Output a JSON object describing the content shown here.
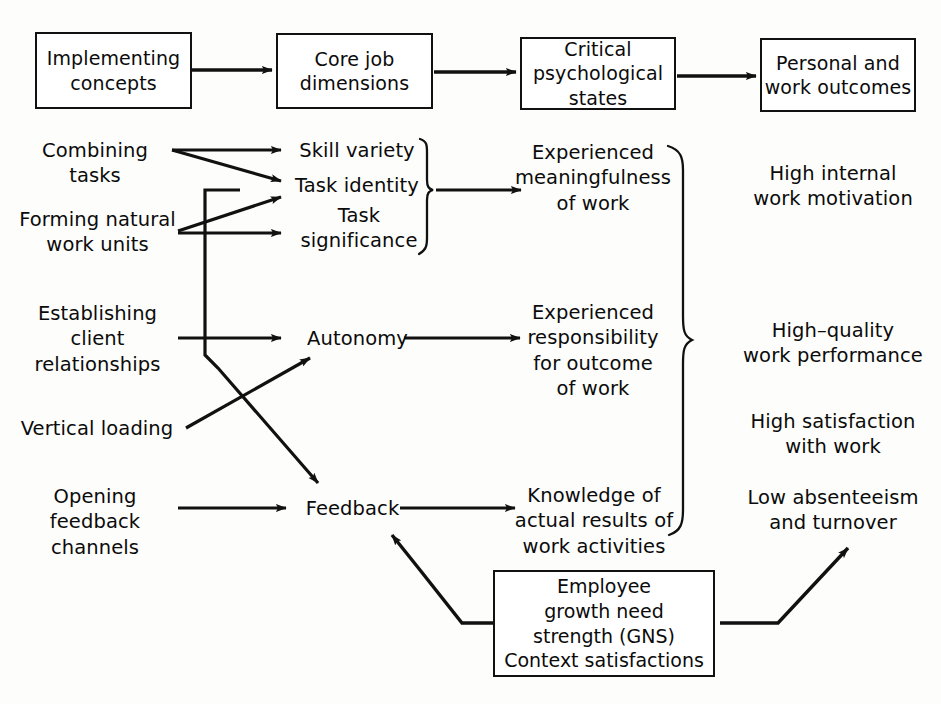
{
  "diagram": {
    "header_boxes": [
      {
        "id": "implementing-concepts",
        "label": "Implementing\nconcepts"
      },
      {
        "id": "core-job-dimensions",
        "label": "Core job\ndimensions"
      },
      {
        "id": "critical-psychological-states",
        "label": "Critical\npsychological\nstates"
      },
      {
        "id": "personal-and-work-outcomes",
        "label": "Personal and\nwork outcomes"
      }
    ],
    "implementing_concepts": [
      {
        "id": "combining-tasks",
        "label": "Combining tasks"
      },
      {
        "id": "forming-natural-work-units",
        "label": "Forming natural\nwork units"
      },
      {
        "id": "establishing-client-relationships",
        "label": "Establishing\nclient\nrelationships"
      },
      {
        "id": "vertical-loading",
        "label": "Vertical loading"
      },
      {
        "id": "opening-feedback-channels",
        "label": "Opening feedback\nchannels"
      }
    ],
    "core_job_dimensions": [
      {
        "id": "skill-variety",
        "label": "Skill variety"
      },
      {
        "id": "task-identity",
        "label": "Task identity"
      },
      {
        "id": "task-significance",
        "label": "Task\nsignificance"
      },
      {
        "id": "autonomy",
        "label": "Autonomy"
      },
      {
        "id": "feedback",
        "label": "Feedback"
      }
    ],
    "critical_psychological_states": [
      {
        "id": "experienced-meaningfulness",
        "label": "Experienced\nmeaningfulness\nof work"
      },
      {
        "id": "experienced-responsibility",
        "label": "Experienced\nresponsibility\nfor outcome\nof work"
      },
      {
        "id": "knowledge-of-results",
        "label": "Knowledge of\nactual results of\nwork activities"
      }
    ],
    "personal_and_work_outcomes": [
      {
        "id": "high-internal-work-motivation",
        "label": "High internal\nwork motivation"
      },
      {
        "id": "high-quality-work-performance",
        "label": "High–quality\nwork performance"
      },
      {
        "id": "high-satisfaction-with-work",
        "label": "High satisfaction\nwith work"
      },
      {
        "id": "low-absenteeism-and-turnover",
        "label": "Low absenteeism\nand turnover"
      }
    ],
    "moderator_box": {
      "id": "employee-growth-need-strength",
      "label": "Employee\ngrowth need\nstrength (GNS)\nContext satisfactions"
    },
    "colors": {
      "stroke": "#111111",
      "text": "#0b0b0b",
      "background": "#fdfdfb",
      "box_fill": "#ffffff"
    }
  }
}
